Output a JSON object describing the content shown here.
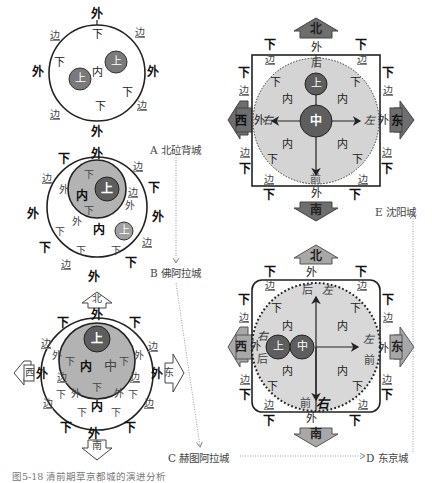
{
  "figure_caption": "图5-18  清前期草京都城的演进分析",
  "colors": {
    "dark_circle": "#6b6b6b",
    "mid_circle": "#a8a8a8",
    "light_fill": "#d4d4d4",
    "line": "#222222",
    "connector": "#999999"
  },
  "stages": [
    {
      "id": "A",
      "caption": "A 北砬背城"
    },
    {
      "id": "B",
      "caption": "B 佛阿拉城"
    },
    {
      "id": "C",
      "caption": "C 赫图阿拉城"
    },
    {
      "id": "D",
      "caption": "D 东京城"
    },
    {
      "id": "E",
      "caption": "E 沈阳城"
    }
  ],
  "terms": {
    "outer": "外",
    "inner": "内",
    "upper": "上",
    "lower": "下",
    "edge": "边",
    "center": "中",
    "rear": "后",
    "front": "前",
    "left": "左",
    "right": "右"
  },
  "directions": {
    "north": "北",
    "south": "南",
    "east": "东",
    "west": "西"
  }
}
